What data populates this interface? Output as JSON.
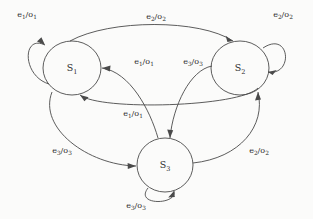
{
  "diagram": {
    "type": "state-transition-diagram",
    "title": "",
    "background_color": "#fbfbfa",
    "stroke_color": "#4a4a4a",
    "text_color": "#2b2b2b",
    "states": [
      {
        "id": "S1",
        "label_base": "S",
        "label_sub": "1",
        "cx": 72,
        "cy": 68,
        "rx": 29,
        "ry": 27
      },
      {
        "id": "S2",
        "label_base": "S",
        "label_sub": "2",
        "cx": 240,
        "cy": 68,
        "rx": 29,
        "ry": 27
      },
      {
        "id": "S3",
        "label_base": "S",
        "label_sub": "3",
        "cx": 165,
        "cy": 165,
        "rx": 28,
        "ry": 27
      }
    ],
    "transitions": [
      {
        "id": "t1",
        "from": "S1",
        "to": "S1",
        "kind": "self-loop",
        "event_base": "e",
        "event_sub": "1",
        "output_base": "o",
        "output_sub": "1",
        "label_x": 27,
        "label_y": 17
      },
      {
        "id": "t2",
        "from": "S2",
        "to": "S2",
        "kind": "self-loop",
        "event_base": "e",
        "event_sub": "2",
        "output_base": "o",
        "output_sub": "2",
        "label_x": 283,
        "label_y": 17
      },
      {
        "id": "t3",
        "from": "S3",
        "to": "S3",
        "kind": "self-loop",
        "event_base": "e",
        "event_sub": "3",
        "output_base": "o",
        "output_sub": "3",
        "label_x": 136,
        "label_y": 208
      },
      {
        "id": "t4",
        "from": "S1",
        "to": "S2",
        "kind": "arc-top",
        "event_base": "e",
        "event_sub": "2",
        "output_base": "o",
        "output_sub": "2",
        "label_x": 156,
        "label_y": 19
      },
      {
        "id": "t5",
        "from": "S2",
        "to": "S1",
        "kind": "arc-middle",
        "event_base": "e",
        "event_sub": "1",
        "output_base": "o",
        "output_sub": "1",
        "label_x": 133,
        "label_y": 116
      },
      {
        "id": "t6",
        "from": "S3",
        "to": "S1",
        "kind": "arc-inner-left",
        "event_base": "e",
        "event_sub": "1",
        "output_base": "o",
        "output_sub": "1",
        "label_x": 144,
        "label_y": 64
      },
      {
        "id": "t7",
        "from": "S2",
        "to": "S3",
        "kind": "arc-inner-right",
        "event_base": "e",
        "event_sub": "3",
        "output_base": "o",
        "output_sub": "3",
        "label_x": 193,
        "label_y": 64
      },
      {
        "id": "t8",
        "from": "S1",
        "to": "S3",
        "kind": "arc-lower-left",
        "event_base": "e",
        "event_sub": "3",
        "output_base": "o",
        "output_sub": "3",
        "label_x": 62,
        "label_y": 153
      },
      {
        "id": "t9",
        "from": "S3",
        "to": "S2",
        "kind": "arc-lower-right",
        "event_base": "e",
        "event_sub": "2",
        "output_base": "o",
        "output_sub": "2",
        "label_x": 259,
        "label_y": 153
      }
    ]
  }
}
